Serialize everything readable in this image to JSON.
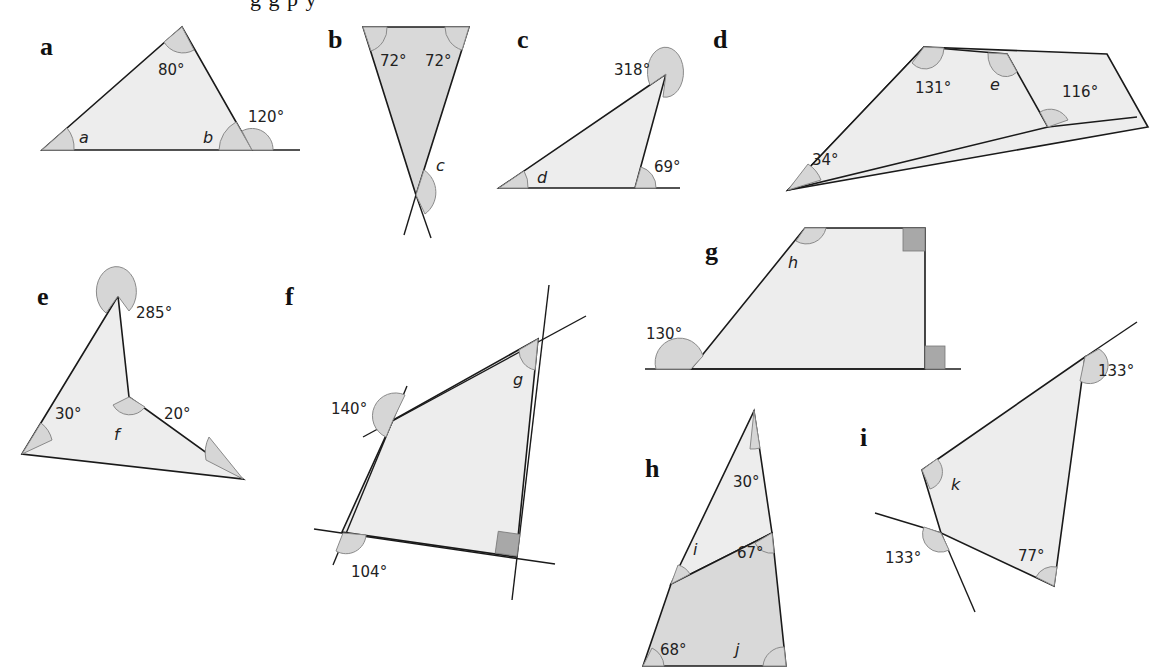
{
  "header": {
    "clipped_text": "g  g    p                      y"
  },
  "panels": [
    {
      "id": "a",
      "label": "a",
      "shape": "triangle",
      "angles": {
        "top": "80°",
        "exterior": "120°"
      },
      "unknowns": [
        "a",
        "b"
      ]
    },
    {
      "id": "b",
      "label": "b",
      "shape": "inverted triangle (crossing lines)",
      "angles": {
        "top_left": "72°",
        "top_right": "72°"
      },
      "unknowns": [
        "c"
      ]
    },
    {
      "id": "c",
      "label": "c",
      "shape": "triangle",
      "angles": {
        "reflex": "318°",
        "exterior": "69°"
      },
      "unknowns": [
        "d"
      ]
    },
    {
      "id": "d",
      "label": "d",
      "shape": "quadrilateral",
      "angles": {
        "top_left": "131°",
        "bottom_left": "34°",
        "exterior": "116°"
      },
      "unknowns": [
        "e"
      ]
    },
    {
      "id": "e",
      "label": "e",
      "shape": "arrowhead (concave quadrilateral)",
      "angles": {
        "reflex_top": "285°",
        "left": "30°",
        "right": "20°"
      },
      "unknowns": [
        "f"
      ]
    },
    {
      "id": "f",
      "label": "f",
      "shape": "quadrilateral with extended sides",
      "angles": {
        "exterior_left": "140°",
        "exterior_bottom": "104°",
        "right_angle": "90°"
      },
      "unknowns": [
        "g"
      ]
    },
    {
      "id": "g",
      "label": "g",
      "shape": "right trapezium",
      "angles": {
        "exterior": "130°",
        "right_angle_top": "90°",
        "right_angle_bottom": "90°"
      },
      "unknowns": [
        "h"
      ]
    },
    {
      "id": "h",
      "label": "h",
      "shape": "split triangle",
      "angles": {
        "top": "30°",
        "inner_right": "67°",
        "bottom_left": "68°"
      },
      "unknowns": [
        "i",
        "j"
      ]
    },
    {
      "id": "i",
      "label": "i",
      "shape": "quadrilateral with extended sides",
      "angles": {
        "exterior_top_right": "133°",
        "exterior_left": "133°",
        "bottom_right": "77°"
      },
      "unknowns": [
        "k"
      ]
    }
  ],
  "text": {
    "a_label": "a",
    "a_80": "80°",
    "a_120": "120°",
    "a_var_a": "a",
    "a_var_b": "b",
    "b_label": "b",
    "b_72l": "72°",
    "b_72r": "72°",
    "b_var_c": "c",
    "c_label": "c",
    "c_318": "318°",
    "c_69": "69°",
    "c_var_d": "d",
    "d_label": "d",
    "d_131": "131°",
    "d_116": "116°",
    "d_34": "34°",
    "d_var_e": "e",
    "e_label": "e",
    "e_285": "285°",
    "e_30": "30°",
    "e_20": "20°",
    "e_var_f": "f",
    "f_label": "f",
    "f_140": "140°",
    "f_104": "104°",
    "f_var_g": "g",
    "g_label": "g",
    "g_130": "130°",
    "g_var_h": "h",
    "h_label": "h",
    "h_30": "30°",
    "h_67": "67°",
    "h_68": "68°",
    "h_var_i": "i",
    "h_var_j": "j",
    "i_label": "i",
    "i_133a": "133°",
    "i_133b": "133°",
    "i_77": "77°",
    "i_var_k": "k"
  },
  "colors": {
    "fill_light": "#ededed",
    "fill_dark": "#d9d9d9",
    "arc": "#d6d6d6",
    "right_angle": "#a8a8a8",
    "stroke": "#1a1a1a"
  }
}
